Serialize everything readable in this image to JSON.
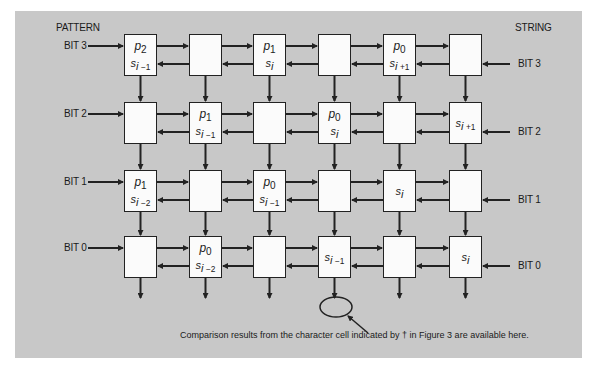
{
  "labels": {
    "pattern": "PATTERN",
    "string": "STRING",
    "left_bits": [
      "BIT 3",
      "BIT 2",
      "BIT 1",
      "BIT 0"
    ],
    "right_bits": [
      "BIT 3",
      "BIT 2",
      "BIT 1",
      "BIT 0"
    ]
  },
  "grid": {
    "rows": 4,
    "cols": 6,
    "cells": [
      [
        {
          "p": "p",
          "psub": "2",
          "s": "i",
          "ssuf": "−1"
        },
        {},
        {
          "p": "p",
          "psub": "1",
          "s": "i",
          "ssuf": ""
        },
        {},
        {
          "p": "p",
          "psub": "0",
          "s": "i",
          "ssuf": "+1"
        },
        {}
      ],
      [
        {},
        {
          "p": "p",
          "psub": "1",
          "s": "i",
          "ssuf": "−1"
        },
        {},
        {
          "p": "p",
          "psub": "0",
          "s": "i",
          "ssuf": ""
        },
        {},
        {
          "s": "i",
          "ssuf": "+1"
        }
      ],
      [
        {
          "p": "p",
          "psub": "1",
          "s": "i",
          "ssuf": "−2"
        },
        {},
        {
          "p": "p",
          "psub": "0",
          "s": "i",
          "ssuf": "−1"
        },
        {},
        {
          "s": "i",
          "ssuf": ""
        },
        {}
      ],
      [
        {},
        {
          "p": "p",
          "psub": "0",
          "s": "i",
          "ssuf": "−2"
        },
        {},
        {
          "s": "i",
          "ssuf": "−1"
        },
        {},
        {
          "s": "i",
          "ssuf": ""
        }
      ]
    ]
  },
  "caption": "Comparison results from the character cell indicated by † in Figure 3 are available here.",
  "colors": {
    "background": "#c8c8c8",
    "cell": "#fbfbfb",
    "line": "#222222"
  }
}
